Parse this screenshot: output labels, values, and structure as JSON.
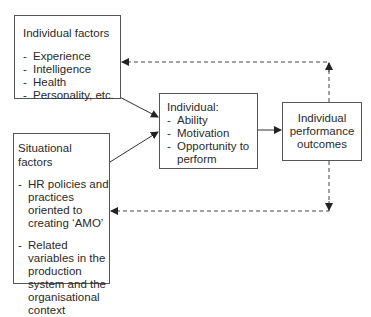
{
  "diagram": {
    "type": "flow-diagram",
    "nodes": {
      "individual_factors": {
        "title": "Individual factors",
        "items": [
          "Experience",
          "Intelligence",
          "Health",
          "Personality, etc."
        ]
      },
      "situational_factors": {
        "title": "Situational factors",
        "items": [
          "HR policies and practices oriented to creating ‘AMO’",
          "Related variables in the production system and the organisational context"
        ]
      },
      "individual": {
        "title": "Individual:",
        "items": [
          "Ability",
          "Motivation",
          "Opportunity to perform"
        ]
      },
      "outcomes": {
        "line1": "Individual",
        "line2": "performance",
        "line3": "outcomes"
      }
    },
    "edges": [
      {
        "from": "individual_factors",
        "to": "individual",
        "style": "solid"
      },
      {
        "from": "situational_factors",
        "to": "individual",
        "style": "solid"
      },
      {
        "from": "individual",
        "to": "outcomes",
        "style": "solid"
      },
      {
        "from": "outcomes",
        "to": "individual_factors",
        "style": "dashed",
        "label": "feedback"
      },
      {
        "from": "outcomes",
        "to": "situational_factors",
        "style": "dashed",
        "label": "feedback"
      }
    ],
    "colors": {
      "line": "#333333",
      "box_border": "#555555",
      "text": "#2a2a2a",
      "background": "#ffffff"
    }
  }
}
